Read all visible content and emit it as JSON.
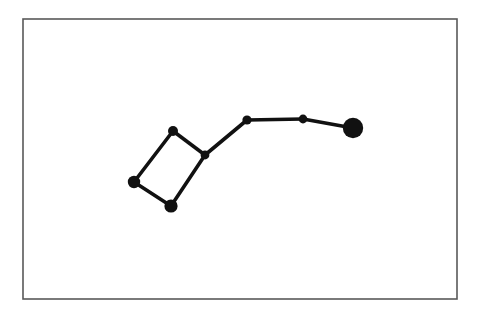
{
  "figure": {
    "kind": "constellation-diagram",
    "canvas": {
      "width": 483,
      "height": 316
    },
    "background_color": "#ffffff",
    "page_color": "#ffffff"
  },
  "frame": {
    "name": "border-frame",
    "x": 23,
    "y": 19,
    "width": 434,
    "height": 280,
    "stroke_color": "#595959",
    "stroke_width": 1.6,
    "fill_color": "#ffffff"
  },
  "style": {
    "line_color": "#111111",
    "line_width": 3.6,
    "node_color": "#111111"
  },
  "chart_data": {
    "type": "scatter",
    "title": "",
    "xlabel": "",
    "ylabel": "",
    "xlim": [
      23,
      457
    ],
    "ylim": [
      19,
      299
    ],
    "grid": false,
    "legend": "none",
    "nodes": [
      {
        "id": "n1",
        "label": "left-bowl-star",
        "x": 134,
        "y": 182,
        "r": 6.2
      },
      {
        "id": "n2",
        "label": "top-bowl-star",
        "x": 173,
        "y": 131,
        "r": 5.0
      },
      {
        "id": "n3",
        "label": "bottom-bowl-star",
        "x": 171,
        "y": 206,
        "r": 6.6
      },
      {
        "id": "n4",
        "label": "bowl-handle-junction",
        "x": 205,
        "y": 155,
        "r": 4.4
      },
      {
        "id": "n5",
        "label": "handle-star-inner",
        "x": 247,
        "y": 120,
        "r": 4.6
      },
      {
        "id": "n6",
        "label": "handle-star-middle",
        "x": 303,
        "y": 119,
        "r": 4.4
      },
      {
        "id": "n7",
        "label": "handle-end-star",
        "x": 353,
        "y": 128,
        "r": 10.2
      }
    ],
    "links": [
      {
        "from": "n2",
        "to": "n1"
      },
      {
        "from": "n1",
        "to": "n3"
      },
      {
        "from": "n3",
        "to": "n4"
      },
      {
        "from": "n4",
        "to": "n2"
      },
      {
        "from": "n4",
        "to": "n5"
      },
      {
        "from": "n5",
        "to": "n6"
      },
      {
        "from": "n6",
        "to": "n7"
      }
    ]
  }
}
